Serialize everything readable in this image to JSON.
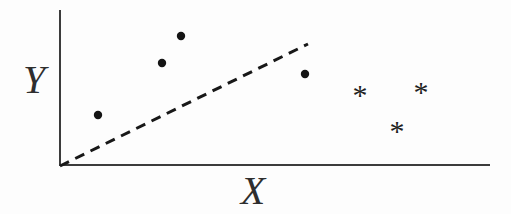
{
  "figure": {
    "width": 511,
    "height": 214,
    "background": "#fdfdfd"
  },
  "chart_data": {
    "type": "scatter",
    "title": "",
    "xlabel": "X",
    "ylabel": "Y",
    "grid": false,
    "tick_labels": [],
    "axes": {
      "color": "#3c3c3c",
      "stroke_width": 2,
      "y_axis": {
        "x": 60,
        "y_top": 10,
        "y_bottom": 166
      },
      "x_axis": {
        "y": 165,
        "x_left": 59,
        "x_right": 490
      }
    },
    "boundary": {
      "style": "dashed",
      "color": "#181818",
      "stroke_width": 3,
      "dash": "10 7",
      "x1": 60,
      "y1": 166,
      "x2": 308,
      "y2": 44
    },
    "series": [
      {
        "name": "dot-class",
        "marker": "filled-circle",
        "color": "#141414",
        "radius": 4.2,
        "points": [
          [
            98,
            115
          ],
          [
            162,
            63
          ],
          [
            181,
            36
          ],
          [
            305,
            74
          ]
        ]
      },
      {
        "name": "asterisk-class",
        "marker": "asterisk",
        "glyph": "*",
        "color": "#1f1f1f",
        "font_size": 30,
        "baseline_factor": 0.46,
        "points": [
          [
            360,
            91
          ],
          [
            421,
            88
          ],
          [
            397,
            127
          ]
        ]
      }
    ],
    "labels": {
      "y": {
        "cx": 34,
        "baseline_y": 93,
        "font_size": 40
      },
      "x": {
        "cx": 253,
        "baseline_y": 204,
        "font_size": 40
      }
    }
  }
}
